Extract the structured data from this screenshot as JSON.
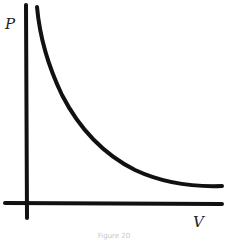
{
  "diagram": {
    "y_axis_label": "P",
    "x_axis_label": "V",
    "caption": "Figure 20",
    "line_color": "#111111",
    "curve": {
      "type": "inverse",
      "description": "P decreases as V increases, approaching the V axis asymptotically"
    }
  }
}
